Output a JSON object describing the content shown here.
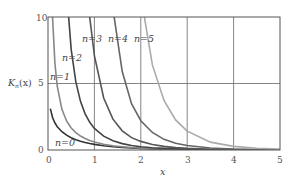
{
  "chart_data": {
    "type": "line",
    "title": "",
    "xlabel": "x",
    "ylabel": "K_n(x)",
    "xlim": [
      0,
      5
    ],
    "ylim": [
      0,
      10
    ],
    "x_ticks": [
      "0",
      "1",
      "2",
      "3",
      "4",
      "5"
    ],
    "y_ticks": [
      "0",
      "5",
      "10"
    ],
    "grid": true,
    "x": [
      0.05,
      0.1,
      0.15,
      0.2,
      0.3,
      0.4,
      0.5,
      0.6,
      0.7,
      0.8,
      0.9,
      1.0,
      1.2,
      1.4,
      1.6,
      1.8,
      2.0,
      2.25,
      2.5,
      2.75,
      3.0,
      3.5,
      4.0,
      4.5,
      5.0
    ],
    "series": [
      {
        "name": "n=0",
        "color": "#333333",
        "values": [
          3.114,
          2.427,
          2.03,
          1.753,
          1.372,
          1.115,
          0.924,
          0.777,
          0.661,
          0.565,
          0.487,
          0.421,
          0.318,
          0.244,
          0.188,
          0.146,
          0.114,
          0.084,
          0.062,
          0.046,
          0.035,
          0.02,
          0.011,
          0.0064,
          0.0037
        ]
      },
      {
        "name": "n=1",
        "color": "#888888",
        "values": [
          19.91,
          9.854,
          6.477,
          4.776,
          3.056,
          2.184,
          1.656,
          1.303,
          1.05,
          0.862,
          0.716,
          0.602,
          0.435,
          0.321,
          0.241,
          0.183,
          0.14,
          0.101,
          0.074,
          0.054,
          0.04,
          0.022,
          0.012,
          0.0071,
          0.004
        ]
      },
      {
        "name": "n=2",
        "color": "#444444",
        "values": [
          799,
          199.5,
          88.5,
          49.51,
          21.75,
          12.04,
          7.55,
          5.12,
          3.66,
          2.72,
          2.08,
          1.62,
          1.04,
          0.7,
          0.48,
          0.34,
          0.25,
          0.17,
          0.12,
          0.082,
          0.062,
          0.032,
          0.017,
          0.0097,
          0.0053
        ]
      },
      {
        "name": "n=3",
        "color": "#555555",
        "values": [
          63970,
          7990,
          2367,
          995,
          293,
          121,
          62.06,
          35.4,
          21.9,
          14.4,
          9.96,
          7.1,
          3.91,
          2.32,
          1.44,
          0.93,
          0.647,
          0.41,
          0.27,
          0.18,
          0.122,
          0.058,
          0.03,
          0.016,
          0.0083
        ]
      },
      {
        "name": "n=4",
        "color": "#666666",
        "values": [
          7677000,
          479600,
          94750,
          29900,
          5881,
          1821,
          744,
          373,
          210,
          129,
          84.6,
          44.2,
          20.7,
          10.6,
          5.9,
          3.48,
          2.2,
          1.32,
          0.8,
          0.51,
          0.34,
          0.15,
          0.069,
          0.034,
          0.017
        ]
      },
      {
        "name": "n=5",
        "color": "#aaaaaa",
        "values": [
          1200000000.0,
          38380000,
          5055000,
          1200000,
          156800,
          36500,
          12020,
          5018,
          2404,
          1300,
          762,
          360,
          148,
          69.6,
          36.2,
          20.1,
          11.6,
          6.4,
          3.72,
          2.26,
          1.42,
          0.59,
          0.27,
          0.13,
          0.064
        ]
      }
    ],
    "annotations": [
      "n=0",
      "n=1",
      "n=2",
      "n=3",
      "n=4",
      "n=5"
    ]
  },
  "labels": {
    "ylabel": "K",
    "ylabel_sub": "n",
    "ylabel_arg": "(x)",
    "xlabel": "x",
    "n0": "n=0",
    "n1": "n=1",
    "n2": "n=2",
    "n3": "n=3",
    "n4": "n=4",
    "n5": "n=5",
    "xt0": "0",
    "xt1": "1",
    "xt2": "2",
    "xt3": "3",
    "xt4": "4",
    "xt5": "5",
    "yt0": "0",
    "yt5": "5",
    "yt10": "10"
  }
}
